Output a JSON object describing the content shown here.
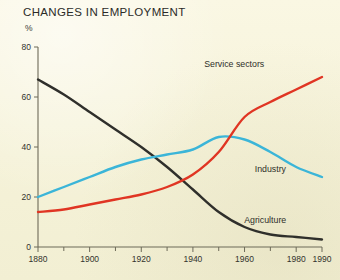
{
  "chart_data": {
    "type": "line",
    "title": "CHANGES IN EMPLOYMENT",
    "xlabel": "",
    "ylabel": "%",
    "ylim": [
      0,
      80
    ],
    "xlim": [
      1880,
      1990
    ],
    "yticks": [
      0,
      20,
      40,
      60,
      80
    ],
    "ytick_labels": [
      "0",
      "20",
      "40",
      "60",
      "80"
    ],
    "xticks": [
      1880,
      1890,
      1900,
      1910,
      1920,
      1930,
      1940,
      1950,
      1960,
      1970,
      1980,
      1990
    ],
    "xtick_labels_major": [
      "1880",
      "1900",
      "1920",
      "1940",
      "1960",
      "1980",
      "1990"
    ],
    "xticks_major": [
      1880,
      1900,
      1920,
      1940,
      1960,
      1980,
      1990
    ],
    "grid": false,
    "legend_position": "inline-annotations",
    "series": [
      {
        "name": "Agriculture",
        "color": "#2f2f2b",
        "label_x": 1968,
        "label_y": 9.5,
        "x": [
          1880,
          1890,
          1900,
          1910,
          1920,
          1930,
          1940,
          1950,
          1960,
          1970,
          1980,
          1990
        ],
        "values": [
          67,
          61,
          54,
          47,
          40,
          32,
          23,
          14,
          8,
          5,
          4,
          3
        ]
      },
      {
        "name": "Industry",
        "color": "#3bb5d8",
        "label_x": 1970,
        "label_y": 30,
        "x": [
          1880,
          1890,
          1900,
          1910,
          1920,
          1930,
          1940,
          1950,
          1960,
          1970,
          1980,
          1990
        ],
        "values": [
          20,
          24,
          28,
          32,
          35,
          37,
          39,
          44,
          43,
          38,
          32,
          28
        ]
      },
      {
        "name": "Service sectors",
        "color": "#e03523",
        "label_x": 1956,
        "label_y": 72,
        "x": [
          1880,
          1890,
          1900,
          1910,
          1920,
          1930,
          1940,
          1950,
          1960,
          1970,
          1980,
          1990
        ],
        "values": [
          14,
          15,
          17,
          19,
          21,
          24,
          29,
          38,
          52,
          58,
          63,
          68
        ]
      }
    ]
  }
}
